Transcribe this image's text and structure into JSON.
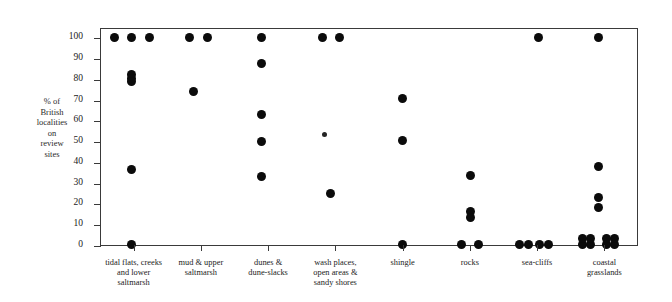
{
  "chart_data": {
    "type": "scatter",
    "title": "",
    "xlabel": "",
    "ylabel": "% of British localities on review sites",
    "ylabel_lines": [
      "% of",
      "British",
      "localities",
      "on",
      "review",
      "sites"
    ],
    "ylim": [
      0,
      105
    ],
    "yticks": [
      0,
      10,
      20,
      30,
      40,
      50,
      60,
      70,
      80,
      90,
      100
    ],
    "ytick_labels": [
      "0",
      "10",
      "20",
      "30",
      "40",
      "50",
      "60",
      "70",
      "80",
      "90",
      "100"
    ],
    "grid": false,
    "legend": null,
    "dot_color": "#0b0b0b",
    "axis_color": "#3a3a3a",
    "categories": [
      {
        "id": "tidal-flats",
        "label_lines": [
          "tidal flats, creeks",
          "and lower",
          "saltmarsh"
        ],
        "label": "tidal flats, creeks and lower saltmarsh",
        "points": [
          {
            "x_offset": -0.3,
            "y": 101
          },
          {
            "x_offset": -0.05,
            "y": 101
          },
          {
            "x_offset": 0.22,
            "y": 101
          },
          {
            "x_offset": -0.05,
            "y": 83
          },
          {
            "x_offset": -0.05,
            "y": 81
          },
          {
            "x_offset": -0.05,
            "y": 79.5
          },
          {
            "x_offset": -0.05,
            "y": 37.5
          },
          {
            "x_offset": -0.05,
            "y": 1
          }
        ]
      },
      {
        "id": "mud-upper-saltmarsh",
        "label_lines": [
          "mud & upper",
          "saltmarsh"
        ],
        "label": "mud & upper saltmarsh",
        "points": [
          {
            "x_offset": -0.18,
            "y": 101
          },
          {
            "x_offset": 0.08,
            "y": 101
          },
          {
            "x_offset": -0.12,
            "y": 75
          }
        ]
      },
      {
        "id": "dunes-dune-slacks",
        "label_lines": [
          "dunes &",
          "dune-slacks"
        ],
        "label": "dunes & dune-slacks",
        "points": [
          {
            "x_offset": -0.12,
            "y": 101
          },
          {
            "x_offset": -0.12,
            "y": 88.5
          },
          {
            "x_offset": -0.12,
            "y": 64
          },
          {
            "x_offset": -0.12,
            "y": 51
          },
          {
            "x_offset": -0.12,
            "y": 34
          }
        ]
      },
      {
        "id": "wash-places",
        "label_lines": [
          "wash places,",
          "open areas &",
          "sandy shores"
        ],
        "label": "wash places, open areas & sandy shores",
        "points": [
          {
            "x_offset": -0.2,
            "y": 101
          },
          {
            "x_offset": 0.04,
            "y": 101
          },
          {
            "x_offset": -0.18,
            "y": 54,
            "small": true
          },
          {
            "x_offset": -0.08,
            "y": 26
          }
        ]
      },
      {
        "id": "shingle",
        "label_lines": [
          "shingle"
        ],
        "label": "shingle",
        "points": [
          {
            "x_offset": -0.02,
            "y": 71.5
          },
          {
            "x_offset": -0.02,
            "y": 51.5
          },
          {
            "x_offset": -0.02,
            "y": 1
          }
        ]
      },
      {
        "id": "rocks",
        "label_lines": [
          "rocks"
        ],
        "label": "rocks",
        "points": [
          {
            "x_offset": 0.0,
            "y": 34.5
          },
          {
            "x_offset": 0.0,
            "y": 17
          },
          {
            "x_offset": 0.0,
            "y": 14
          },
          {
            "x_offset": -0.14,
            "y": 1
          },
          {
            "x_offset": 0.12,
            "y": 1
          }
        ]
      },
      {
        "id": "sea-cliffs",
        "label_lines": [
          "sea-cliffs"
        ],
        "label": "sea-cliffs",
        "points": [
          {
            "x_offset": 0.0,
            "y": 101
          },
          {
            "x_offset": -0.28,
            "y": 1
          },
          {
            "x_offset": -0.14,
            "y": 1
          },
          {
            "x_offset": 0.02,
            "y": 1
          },
          {
            "x_offset": 0.16,
            "y": 1
          }
        ]
      },
      {
        "id": "coastal-grasslands",
        "label_lines": [
          "coastal",
          "grasslands"
        ],
        "label": "coastal grasslands",
        "points": [
          {
            "x_offset": -0.1,
            "y": 101
          },
          {
            "x_offset": -0.1,
            "y": 39
          },
          {
            "x_offset": -0.1,
            "y": 24
          },
          {
            "x_offset": -0.1,
            "y": 19
          },
          {
            "x_offset": -0.34,
            "y": 1
          },
          {
            "x_offset": -0.22,
            "y": 1
          },
          {
            "x_offset": -0.34,
            "y": 4
          },
          {
            "x_offset": -0.22,
            "y": 4
          },
          {
            "x_offset": 0.02,
            "y": 1
          },
          {
            "x_offset": 0.14,
            "y": 1
          },
          {
            "x_offset": 0.02,
            "y": 4
          },
          {
            "x_offset": 0.14,
            "y": 4
          }
        ]
      }
    ]
  }
}
